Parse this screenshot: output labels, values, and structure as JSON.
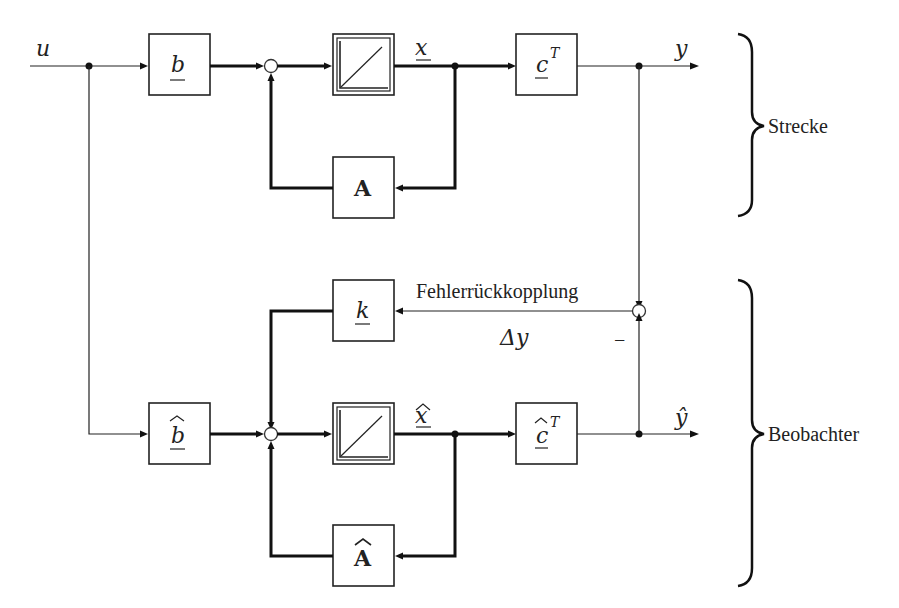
{
  "diagram": {
    "input_label": "u",
    "output_label": "y",
    "observer_output_label": "ŷ",
    "plant": {
      "input_block": "b",
      "integrator": "∫",
      "state_label": "x",
      "output_block": "c",
      "output_block_sup": "T",
      "feedback_block": "A"
    },
    "observer": {
      "input_block": "b",
      "integrator": "∫",
      "state_label": "x",
      "output_block": "c",
      "output_block_sup": "T",
      "feedback_block": "A",
      "gain_block": "k"
    },
    "error_feedback_label": "Fehlerrückkopplung",
    "error_signal_label": "Δy",
    "minus_sign": "−",
    "groups": {
      "plant": "Strecke",
      "observer": "Beobachter"
    }
  }
}
